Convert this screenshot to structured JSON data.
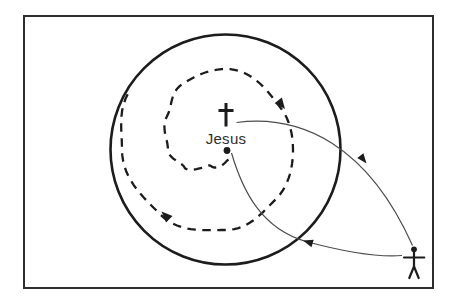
{
  "diagram": {
    "jesus_label": "Jesus",
    "icons": {
      "center": "cross-icon",
      "outsider": "person-icon"
    },
    "colors": {
      "ink": "#1c1c1c",
      "thin_line": "#4d4d4d",
      "frame": "#2e2e2e",
      "background": "#ffffff"
    }
  }
}
